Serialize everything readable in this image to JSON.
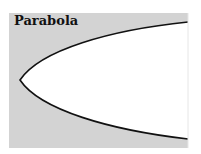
{
  "figure": {
    "title": "Parabola",
    "colors": {
      "background": "#d3d3d3",
      "interior": "#ffffff",
      "curve": "#111111"
    }
  }
}
